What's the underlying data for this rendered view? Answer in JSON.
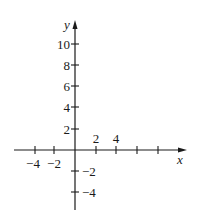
{
  "diagram": {
    "type": "cartesian-axes",
    "x_axis": {
      "label": "x",
      "tick_labels": [
        {
          "value": -4,
          "text": "−4"
        },
        {
          "value": -2,
          "text": "−2"
        },
        {
          "value": 2,
          "text": "2"
        },
        {
          "value": 4,
          "text": "4"
        }
      ],
      "unlabeled_ticks": [
        6,
        8
      ]
    },
    "y_axis": {
      "label": "y",
      "tick_labels": [
        {
          "value": 10,
          "text": "10"
        },
        {
          "value": 8,
          "text": "8"
        },
        {
          "value": 6,
          "text": "6"
        },
        {
          "value": 4,
          "text": "4"
        },
        {
          "value": 2,
          "text": "2"
        },
        {
          "value": -2,
          "text": "−2"
        },
        {
          "value": -4,
          "text": "−4"
        }
      ]
    },
    "colors": {
      "axis": "#1a1a1a",
      "background": "#ffffff"
    }
  }
}
